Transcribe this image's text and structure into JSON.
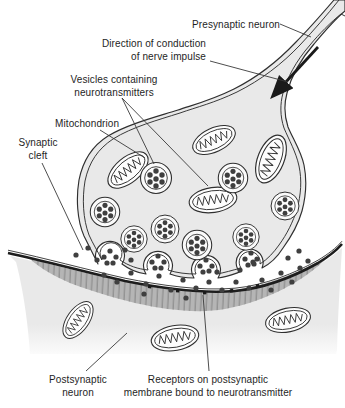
{
  "figure": {
    "labels": {
      "presynaptic_neuron": "Presynaptic neuron",
      "direction_line1": "Direction of conduction",
      "direction_line2": "of nerve impulse",
      "vesicles_line1": "Vesicles containing",
      "vesicles_line2": "neurotransmitters",
      "mitochondrion": "Mitochondrion",
      "cleft_line1": "Synaptic",
      "cleft_line2": "cleft",
      "postsynaptic_line1": "Postsynaptic",
      "postsynaptic_line2": "neuron",
      "receptors_line1": "Receptors on postsynaptic",
      "receptors_line2": "membrane bound to neurotransmitter"
    },
    "colors": {
      "background": "#ffffff",
      "outline": "#2f2f2f",
      "cytoplasm": "#e9e9e9",
      "neurotransmitter_dot": "#3f3f3f",
      "receptor_band": "#b5b5b5",
      "text": "#1e1e1e"
    }
  }
}
